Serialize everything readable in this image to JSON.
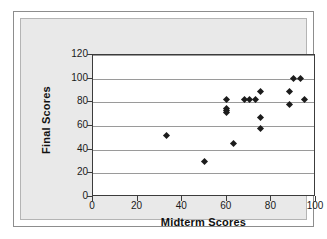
{
  "chart_data": {
    "type": "scatter",
    "title": "",
    "xlabel": "Midterm Scores",
    "ylabel": "Final Scores",
    "xlim": [
      0,
      100
    ],
    "ylim": [
      0,
      120
    ],
    "xticks": [
      0,
      20,
      40,
      60,
      80,
      100
    ],
    "yticks": [
      0,
      20,
      40,
      60,
      80,
      100,
      120
    ],
    "grid": "horizontal",
    "legend": "none",
    "marker": "diamond",
    "marker_color": "#1c1c1c",
    "points": [
      {
        "x": 33,
        "y": 52
      },
      {
        "x": 50,
        "y": 30
      },
      {
        "x": 60,
        "y": 82
      },
      {
        "x": 60,
        "y": 75
      },
      {
        "x": 60,
        "y": 73
      },
      {
        "x": 60,
        "y": 71
      },
      {
        "x": 63,
        "y": 45
      },
      {
        "x": 68,
        "y": 82
      },
      {
        "x": 70,
        "y": 82
      },
      {
        "x": 73,
        "y": 82
      },
      {
        "x": 75,
        "y": 89
      },
      {
        "x": 75,
        "y": 67
      },
      {
        "x": 75,
        "y": 58
      },
      {
        "x": 88,
        "y": 89
      },
      {
        "x": 88,
        "y": 78
      },
      {
        "x": 90,
        "y": 100
      },
      {
        "x": 93,
        "y": 100
      },
      {
        "x": 95,
        "y": 82
      }
    ]
  },
  "figure": {
    "background": "#ffffff",
    "panel_background": "#e9e9e9",
    "plot_background": "#ffffff",
    "axis_color": "#3c3c3c",
    "grid_color": "#9a9a9a"
  }
}
